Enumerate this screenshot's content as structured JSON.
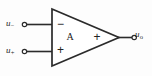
{
  "figure": {
    "name": "operational-amplifier-symbol",
    "type": "schematic",
    "background_color": "#fdfdfd",
    "line_color": "#2b2b2b"
  },
  "amplifier": {
    "gain_label": "A",
    "inverting_sign": "−",
    "noninverting_sign": "+",
    "output_sign": "+"
  },
  "ports": {
    "inverting_input": {
      "symbol": "u",
      "subscript": "−",
      "terminal": "open-circle"
    },
    "noninverting_input": {
      "symbol": "u",
      "subscript": "+",
      "terminal": "open-circle"
    },
    "output": {
      "symbol": "u",
      "subscript": "o",
      "terminal": "open-circle"
    }
  }
}
